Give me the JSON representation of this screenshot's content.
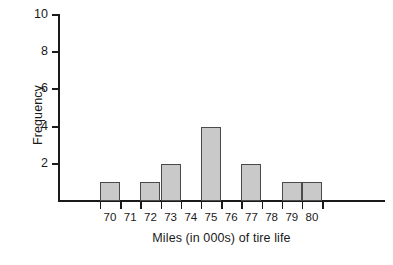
{
  "chart_data": {
    "type": "bar",
    "title": "",
    "subtitle": "",
    "xlabel": "Miles (in 000s) of tire life",
    "ylabel": "Frequency",
    "categories": [
      "70",
      "71",
      "72",
      "73",
      "74",
      "75",
      "76",
      "77",
      "78",
      "79",
      "80"
    ],
    "values": [
      1,
      0,
      1,
      2,
      0,
      4,
      0,
      2,
      0,
      1,
      1
    ],
    "xlim": [
      69.5,
      80.5
    ],
    "ylim": [
      0,
      10
    ],
    "y_ticks": [
      "10",
      "8",
      "6",
      "4",
      "2"
    ],
    "y_tick_values": [
      10,
      8,
      6,
      4,
      2
    ],
    "grid": false,
    "legend": false,
    "legend_position": "none",
    "bar_fill_color": "#c9c9c9",
    "bar_edge_color": "#4a4a4a",
    "axis_color": "#1a1a1a",
    "background_color": "#ffffff"
  }
}
